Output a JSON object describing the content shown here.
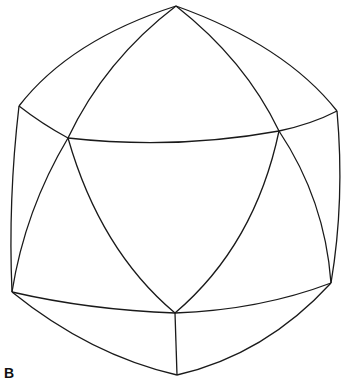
{
  "figure": {
    "panel_label": "B",
    "stroke_color": "#1a1a1a",
    "vertices": {
      "top": [
        176,
        6
      ],
      "left": [
        19,
        106
      ],
      "right": [
        337,
        111
      ],
      "mid_left": [
        68,
        138
      ],
      "mid_right": [
        279,
        131
      ],
      "bottom_left": [
        12,
        292
      ],
      "bottom_right": [
        331,
        283
      ],
      "bottom_center": [
        175,
        313
      ],
      "bottom": [
        177,
        375
      ]
    }
  }
}
